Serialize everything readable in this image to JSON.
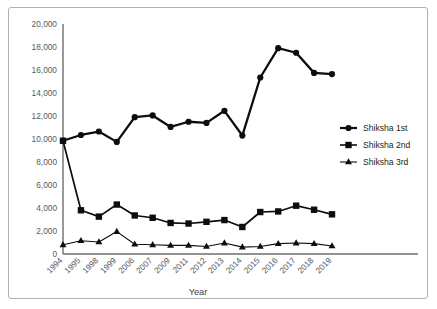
{
  "chart_data": {
    "type": "line",
    "title": "",
    "xlabel": "Year",
    "ylabel": "",
    "grid": false,
    "legend_position": "right-middle",
    "categories": [
      "1994",
      "1995",
      "1998",
      "1999",
      "2006",
      "2007",
      "2009",
      "2011",
      "2012",
      "2013",
      "2014",
      "2015",
      "2016",
      "2017",
      "2018",
      "2019"
    ],
    "ylim": [
      0,
      20000
    ],
    "ytick_labels": [
      "0",
      "2,000",
      "4,000",
      "6,000",
      "8,000",
      "10,000",
      "12,000",
      "14,000",
      "16,000",
      "18,000",
      "20,000"
    ],
    "ytick_values": [
      0,
      2000,
      4000,
      6000,
      8000,
      10000,
      12000,
      14000,
      16000,
      18000,
      20000
    ],
    "series": [
      {
        "name": "Shiksha 1st",
        "marker": "circle",
        "color": "#0d0d0d",
        "values": [
          9850,
          10350,
          10650,
          9750,
          11900,
          12050,
          11050,
          11500,
          11400,
          12450,
          10300,
          15350,
          17900,
          17500,
          15750,
          15650
        ]
      },
      {
        "name": "Shiksha 2nd",
        "marker": "square",
        "color": "#0d0d0d",
        "values": [
          9850,
          3800,
          3250,
          4300,
          3350,
          3150,
          2700,
          2650,
          2800,
          2950,
          2350,
          3650,
          3700,
          4200,
          3850,
          3450
        ]
      },
      {
        "name": "Shiksha 3rd",
        "marker": "triangle",
        "color": "#0d0d0d",
        "values": [
          800,
          1150,
          1050,
          1950,
          850,
          800,
          750,
          750,
          650,
          950,
          600,
          650,
          900,
          950,
          900,
          700
        ]
      }
    ]
  },
  "legend": {
    "items": [
      {
        "label": "Shiksha 1st",
        "marker": "circle"
      },
      {
        "label": "Shiksha 2nd",
        "marker": "square"
      },
      {
        "label": "Shiksha 3rd",
        "marker": "triangle"
      }
    ]
  },
  "axes": {
    "x_title": "Year"
  }
}
